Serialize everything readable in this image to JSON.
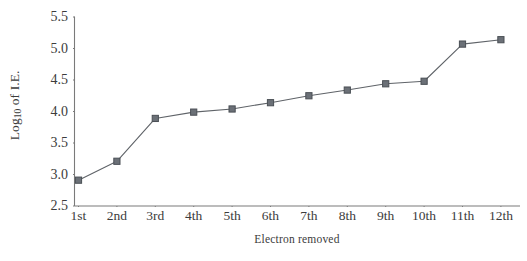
{
  "chart_data": {
    "type": "line",
    "title": "",
    "subtitle": "",
    "xlabel": "Electron removed",
    "ylabel": "Log10 of I.E.",
    "ylabel_prefix": "Log",
    "ylabel_subscript": "10",
    "ylabel_suffix": " of I.E.",
    "categories": [
      "1st",
      "2nd",
      "3rd",
      "4th",
      "5th",
      "6th",
      "7th",
      "8th",
      "9th",
      "10th",
      "11th",
      "12th"
    ],
    "values": [
      2.91,
      3.21,
      3.89,
      3.99,
      4.04,
      4.14,
      4.25,
      4.34,
      4.44,
      4.48,
      5.07,
      5.14
    ],
    "series": [
      {
        "name": "Log10 of I.E.",
        "values": [
          2.91,
          3.21,
          3.89,
          3.99,
          4.04,
          4.14,
          4.25,
          4.34,
          4.44,
          4.48,
          5.07,
          5.14
        ]
      }
    ],
    "ylim": [
      2.5,
      5.5
    ],
    "yticks": [
      "5.5",
      "5.0",
      "4.5",
      "4.0",
      "3.5",
      "3.0",
      "2.5"
    ],
    "ytick_values": [
      5.5,
      5.0,
      4.5,
      4.0,
      3.5,
      3.0,
      2.5
    ],
    "xticks": [
      "1st",
      "2nd",
      "3rd",
      "4th",
      "5th",
      "6th",
      "7th",
      "8th",
      "9th",
      "10th",
      "11th",
      "12th"
    ],
    "grid": false,
    "legend": false,
    "legend_position": "none",
    "marker": "square",
    "line_color": "#5f6368",
    "marker_color": "#6b7077",
    "marker_edge_color": "#4a4f55",
    "axis_color": "#7a7a7a",
    "text_color": "#3c3c3c",
    "background_color": "#ffffff"
  }
}
